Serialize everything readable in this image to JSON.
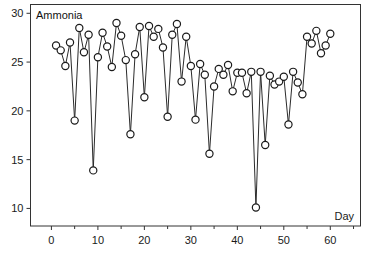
{
  "chart_data": {
    "type": "line",
    "title": "",
    "panel_label": "Ammonia",
    "xlabel": "Day",
    "ylabel": "",
    "xlim": [
      -4.5,
      66.5
    ],
    "ylim": [
      8.2,
      30.9
    ],
    "xticks": [
      0,
      10,
      20,
      30,
      40,
      50,
      60
    ],
    "xminor_ticks": [
      5,
      15,
      25,
      35,
      45,
      55,
      65
    ],
    "yticks": [
      10,
      15,
      20,
      25,
      30
    ],
    "grid": false,
    "legend": null,
    "marker": "open-circle",
    "series": [
      {
        "name": "Ammonia",
        "x": [
          1,
          2,
          3,
          4,
          5,
          6,
          7,
          8,
          9,
          10,
          11,
          12,
          13,
          14,
          15,
          16,
          17,
          18,
          19,
          20,
          21,
          22,
          23,
          24,
          25,
          26,
          27,
          28,
          29,
          30,
          31,
          32,
          33,
          34,
          35,
          36,
          37,
          38,
          39,
          40,
          41,
          42,
          43,
          44,
          45,
          46,
          47,
          48,
          49,
          50,
          51,
          52,
          53,
          54,
          55,
          56,
          57,
          58,
          59,
          60
        ],
        "values": [
          26.7,
          26.2,
          24.6,
          27.0,
          19.0,
          28.5,
          26.0,
          27.8,
          13.9,
          25.5,
          28.0,
          26.6,
          24.5,
          29.0,
          27.7,
          25.2,
          17.6,
          25.8,
          28.6,
          21.4,
          28.7,
          27.6,
          28.4,
          26.5,
          19.4,
          27.8,
          28.9,
          23.0,
          27.6,
          24.6,
          19.1,
          24.8,
          23.7,
          15.6,
          22.5,
          24.3,
          23.7,
          24.7,
          22.0,
          23.9,
          23.9,
          21.8,
          24.0,
          10.1,
          24.0,
          16.5,
          23.6,
          22.7,
          23.0,
          23.5,
          18.6,
          24.0,
          22.9,
          21.7,
          27.6,
          26.9,
          28.2,
          25.9,
          26.7,
          27.9
        ]
      }
    ]
  },
  "colors": {
    "line": "#2b2b2b",
    "marker_stroke": "#1a1a1a",
    "axis": "#333333",
    "background": "#ffffff"
  }
}
